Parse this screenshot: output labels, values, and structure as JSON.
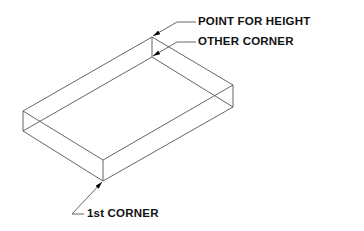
{
  "diagram": {
    "type": "isometric box construction",
    "labels": {
      "point_for_height": "POINT FOR HEIGHT",
      "other_corner": "OTHER CORNER",
      "first_corner": "1st CORNER"
    },
    "colors": {
      "line": "#555555",
      "text": "#111111",
      "background": "#ffffff"
    },
    "vertices": {
      "back_top": [
        152,
        37
      ],
      "back_bottom": [
        152,
        57
      ],
      "right_top": [
        233,
        85
      ],
      "right_bottom": [
        233,
        107
      ],
      "left_top": [
        23,
        111
      ],
      "left_bottom": [
        23,
        131
      ],
      "front_top": [
        103,
        160
      ],
      "front_bottom": [
        103,
        181
      ]
    }
  }
}
